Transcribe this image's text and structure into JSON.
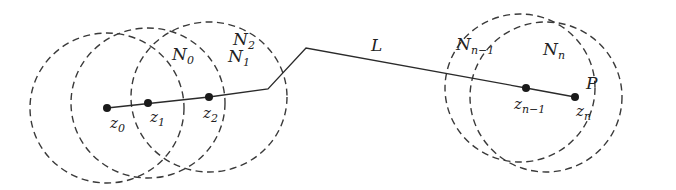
{
  "diagram": {
    "path_label": "L",
    "endpoint_label": "P",
    "neighborhoods": [
      {
        "id": "N0",
        "base": "N",
        "sub": "0",
        "cx": 107,
        "cy": 108,
        "rx": 77,
        "ry": 75,
        "label_x": 172,
        "label_y": 60
      },
      {
        "id": "N1",
        "base": "N",
        "sub": "1",
        "cx": 148,
        "cy": 103,
        "rx": 77,
        "ry": 75,
        "label_x": 228,
        "label_y": 62
      },
      {
        "id": "N2",
        "base": "N",
        "sub": "2",
        "cx": 209,
        "cy": 97,
        "rx": 78,
        "ry": 75,
        "label_x": 233,
        "label_y": 45
      },
      {
        "id": "Nn-1",
        "base": "N",
        "sub": "n−1",
        "cx": 520,
        "cy": 88,
        "rx": 75,
        "ry": 74,
        "label_x": 456,
        "label_y": 50
      },
      {
        "id": "Nn",
        "base": "N",
        "sub": "n",
        "cx": 546,
        "cy": 97,
        "rx": 76,
        "ry": 75,
        "label_x": 543,
        "label_y": 55
      }
    ],
    "points": [
      {
        "id": "z0",
        "base": "z",
        "sub": "0",
        "x": 107,
        "y": 108,
        "label_x": 110,
        "label_y": 128
      },
      {
        "id": "z1",
        "base": "z",
        "sub": "1",
        "x": 148,
        "y": 103,
        "label_x": 150,
        "label_y": 122
      },
      {
        "id": "z2",
        "base": "z",
        "sub": "2",
        "x": 209,
        "y": 97,
        "label_x": 203,
        "label_y": 118
      },
      {
        "id": "zn-1",
        "base": "z",
        "sub": "n−1",
        "x": 526,
        "y": 88,
        "label_x": 514,
        "label_y": 109
      },
      {
        "id": "zn",
        "base": "z",
        "sub": "n",
        "x": 575,
        "y": 97,
        "label_x": 576,
        "label_y": 116
      }
    ],
    "polyline": [
      [
        107,
        108
      ],
      [
        209,
        97
      ],
      [
        268,
        89
      ],
      [
        306,
        48
      ],
      [
        526,
        88
      ],
      [
        575,
        97
      ]
    ],
    "labels": {
      "L": {
        "text": "L",
        "x": 371,
        "y": 51
      },
      "P": {
        "text": "P",
        "x": 586,
        "y": 89
      }
    }
  }
}
